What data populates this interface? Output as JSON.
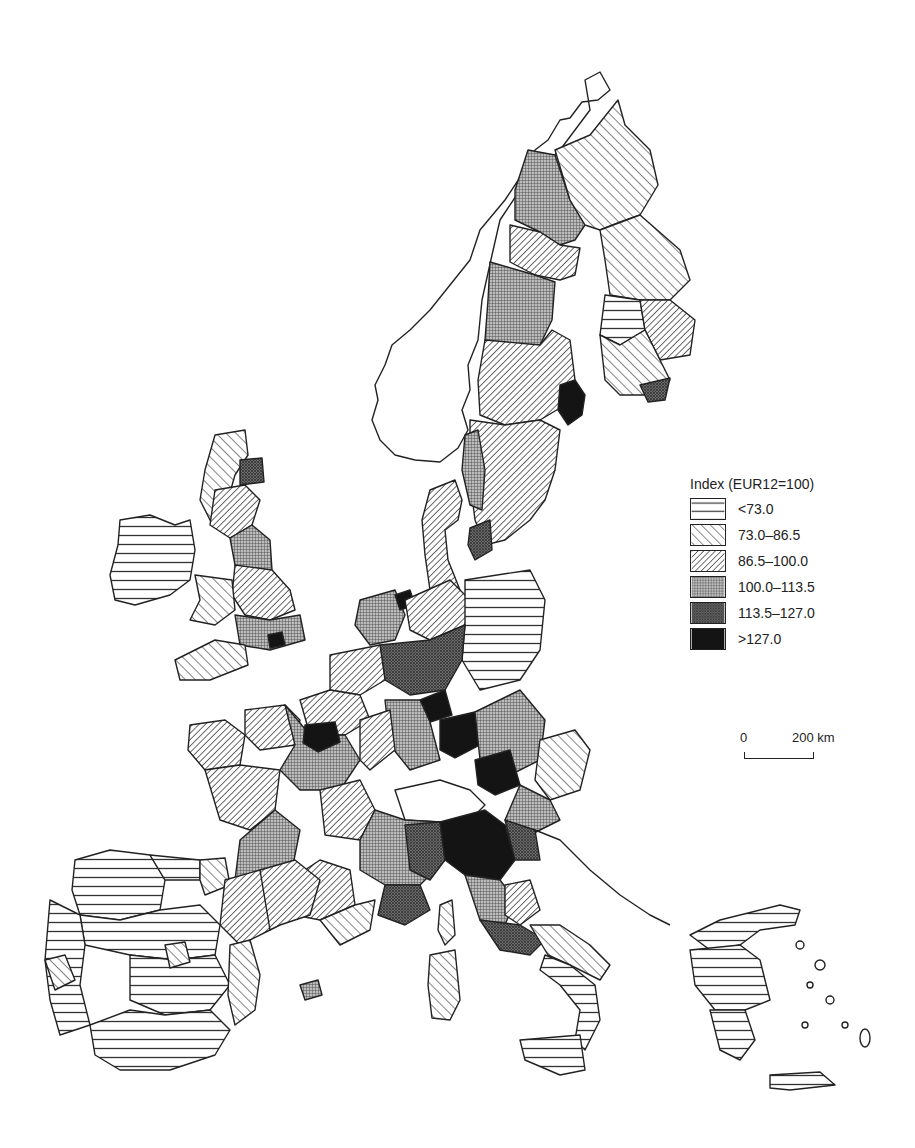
{
  "map": {
    "subject": "Regional index map of Western Europe (EUR12=100)",
    "legend": {
      "title": "Index (EUR12=100)",
      "classes": [
        {
          "label": "<73.0",
          "pattern": "horizontal-lines",
          "pattern_id": "p-horiz"
        },
        {
          "label": "73.0–86.5",
          "pattern": "wide-diagonal-forward",
          "pattern_id": "p-diag-wide"
        },
        {
          "label": "86.5–100.0",
          "pattern": "dense-diagonal-back",
          "pattern_id": "p-diag-dense"
        },
        {
          "label": "100.0–113.5",
          "pattern": "fine-grid",
          "pattern_id": "p-grid"
        },
        {
          "label": "113.5–127.0",
          "pattern": "dark-crosshatch",
          "pattern_id": "p-dark"
        },
        {
          "label": ">127.0",
          "pattern": "solid-black",
          "pattern_id": "p-black"
        }
      ]
    },
    "scale_bar": {
      "start_label": "0",
      "end_label": "200 km"
    },
    "colors": {
      "stroke": "#222222",
      "background": "#ffffff",
      "grid_fill": "#8a8a8a",
      "dark_fill": "#555555",
      "black_fill": "#111111"
    },
    "countries_visible": [
      "Norway",
      "Sweden",
      "Finland",
      "Denmark",
      "United Kingdom",
      "Ireland",
      "Netherlands",
      "Belgium",
      "Luxembourg",
      "Germany",
      "France",
      "Switzerland",
      "Austria",
      "Italy",
      "Spain",
      "Portugal",
      "Greece",
      "Croatia/Adriatic coast"
    ]
  }
}
